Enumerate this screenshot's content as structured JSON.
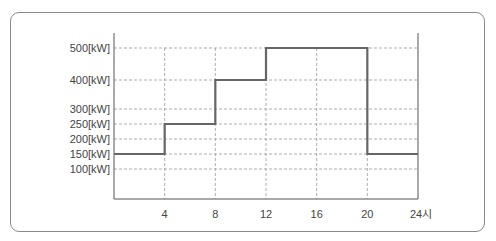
{
  "chart_data": {
    "type": "line",
    "step": true,
    "title": "",
    "xlabel": "",
    "ylabel": "",
    "x_ticks": [
      4,
      8,
      12,
      16,
      20,
      24
    ],
    "x_tick_labels": [
      "4",
      "8",
      "12",
      "16",
      "20",
      "24시"
    ],
    "y_ticks": [
      100,
      150,
      200,
      250,
      300,
      400,
      500
    ],
    "y_tick_labels": [
      "100[kW]",
      "150[kW]",
      "200[kW]",
      "250[kW]",
      "300[kW]",
      "400[kW]",
      "500[kW]"
    ],
    "xlim": [
      0,
      24
    ],
    "ylim": [
      0,
      550
    ],
    "grid": true,
    "grid_style": "dashed",
    "series": [
      {
        "name": "load",
        "x": [
          0,
          4,
          8,
          12,
          20,
          24
        ],
        "values": [
          150,
          250,
          400,
          500,
          150,
          150
        ],
        "segments": [
          {
            "from": 0,
            "to": 4,
            "value": 150
          },
          {
            "from": 4,
            "to": 8,
            "value": 250
          },
          {
            "from": 8,
            "to": 12,
            "value": 400
          },
          {
            "from": 12,
            "to": 20,
            "value": 500
          },
          {
            "from": 20,
            "to": 24,
            "value": 150
          }
        ]
      }
    ],
    "colors": {
      "line": "#666666",
      "grid": "#9a9a9a",
      "axis": "#555555",
      "frame": "#8a8a8a"
    }
  }
}
